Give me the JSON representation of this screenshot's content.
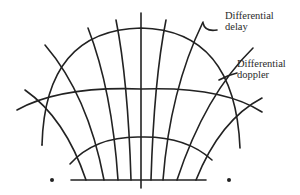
{
  "diagram": {
    "labels": {
      "delay_line1": "Differential",
      "delay_line2": "delay",
      "doppler_line1": "Differential",
      "doppler_line2": "doppler"
    },
    "colors": {
      "stroke": "#222222",
      "background": "#ffffff"
    },
    "elements": {
      "delay_contours": 3,
      "doppler_contours": 10,
      "receiver_dots": 2
    }
  }
}
